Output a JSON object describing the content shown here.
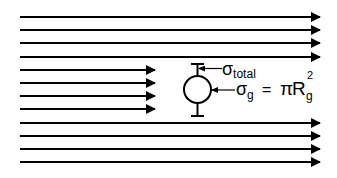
{
  "diagram": {
    "colors": {
      "line": "#000000",
      "background": "#ffffff"
    },
    "long_arrows_top_y": [
      17,
      30,
      43,
      57
    ],
    "short_arrows_y": [
      70,
      83,
      96,
      109
    ],
    "long_arrows_bottom_y": [
      123,
      136,
      149,
      162
    ],
    "labels": {
      "sigma_total_symbol": "σ",
      "sigma_total_sub": "total",
      "sigma_g_symbol": "σ",
      "sigma_g_sub": "g",
      "equals": "=",
      "pi": "π",
      "R": "R",
      "R_sub": "g",
      "R_sup": "2"
    }
  }
}
